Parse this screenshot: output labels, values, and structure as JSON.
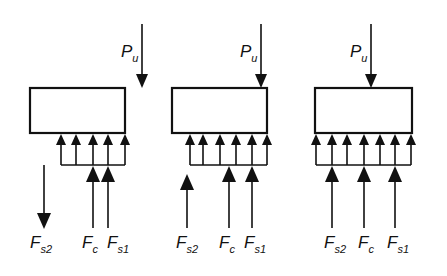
{
  "figure": {
    "panels": [
      {
        "id": "panel-1",
        "load_label": "P",
        "load_sub": "u",
        "forces": [
          {
            "name": "F",
            "sub": "s2",
            "direction": "down"
          },
          {
            "name": "F",
            "sub": "c",
            "direction": "up"
          },
          {
            "name": "F",
            "sub": "s1",
            "direction": "up"
          }
        ]
      },
      {
        "id": "panel-2",
        "load_label": "P",
        "load_sub": "u",
        "forces": [
          {
            "name": "F",
            "sub": "s2",
            "direction": "up"
          },
          {
            "name": "F",
            "sub": "c",
            "direction": "up"
          },
          {
            "name": "F",
            "sub": "s1",
            "direction": "up"
          }
        ]
      },
      {
        "id": "panel-3",
        "load_label": "P",
        "load_sub": "u",
        "forces": [
          {
            "name": "F",
            "sub": "s2",
            "direction": "up"
          },
          {
            "name": "F",
            "sub": "c",
            "direction": "up"
          },
          {
            "name": "F",
            "sub": "s1",
            "direction": "up"
          }
        ]
      }
    ]
  }
}
